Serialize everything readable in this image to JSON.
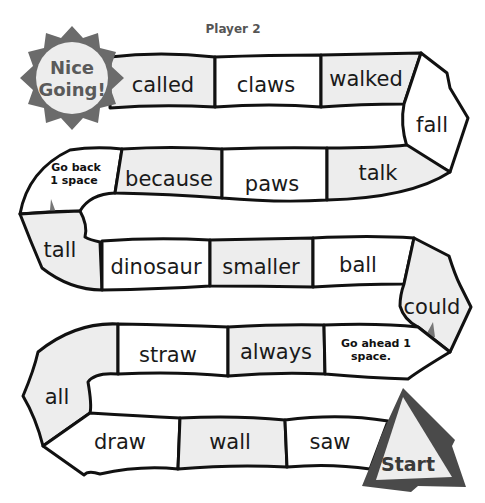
{
  "header": {
    "title": "Player 2"
  },
  "finish": {
    "label_line1": "Nice",
    "label_line2": "Going!",
    "color": "#6b6b6b"
  },
  "start": {
    "label": "Start",
    "color": "#4a4a4a"
  },
  "row1": {
    "called": "called",
    "claws": "claws",
    "walked": "walked"
  },
  "turn1": {
    "fall": "fall"
  },
  "row2": {
    "go_back_line1": "Go back",
    "go_back_line2": "1 space",
    "because": "because",
    "paws": "paws",
    "talk": "talk"
  },
  "turn2": {
    "tall": "tall"
  },
  "row3": {
    "dinosaur": "dinosaur",
    "smaller": "smaller",
    "ball": "ball"
  },
  "turn3": {
    "could": "could"
  },
  "row4": {
    "straw": "straw",
    "always": "always",
    "go_ahead_line1": "Go ahead 1",
    "go_ahead_line2": "space."
  },
  "turn4": {
    "all": "all"
  },
  "row5": {
    "draw": "draw",
    "wall": "wall",
    "saw": "saw"
  },
  "colors": {
    "cell_white": "#ffffff",
    "cell_gray": "#ededed",
    "outline": "#111111",
    "arrow": "#777777"
  }
}
